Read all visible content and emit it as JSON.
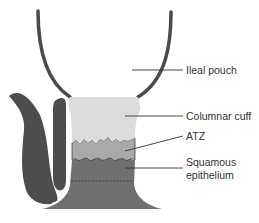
{
  "diagram": {
    "labels": {
      "ileal_pouch": "Ileal pouch",
      "columnar_cuff": "Columnar cuff",
      "atz": "ATZ",
      "squamous_line1": "Squamous",
      "squamous_line2": "epithelium"
    },
    "colors": {
      "wall": "#4a4a4a",
      "cuff": "#dcdcdc",
      "atz": "#a9a9a9",
      "squamous": "#707070",
      "sphincter": "#4d4d4d",
      "leader": "#333333",
      "background": "#ffffff"
    }
  }
}
